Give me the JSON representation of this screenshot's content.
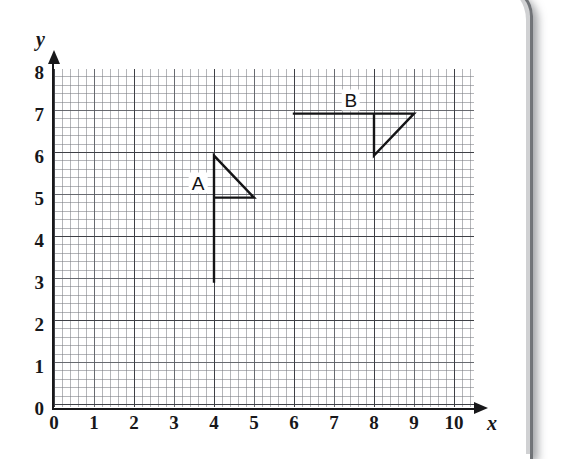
{
  "figure": {
    "type": "coordinate-grid-diagram",
    "grid": {
      "minor_divisions_per_unit": 5,
      "major_gridline_every": 2,
      "grid_color": "#787a80",
      "major_grid_color": "#3c3e44",
      "background": "#ffffff"
    },
    "axes": {
      "x": {
        "name": "x",
        "min": 0,
        "max": 10,
        "tick_step": 1,
        "ticks": [
          "0",
          "1",
          "2",
          "3",
          "4",
          "5",
          "6",
          "7",
          "8",
          "9",
          "10"
        ],
        "arrow": true,
        "color": "#18181a"
      },
      "y": {
        "name": "y",
        "min": 0,
        "max": 8,
        "tick_step": 1,
        "ticks": [
          "0",
          "1",
          "2",
          "3",
          "4",
          "5",
          "6",
          "7",
          "8"
        ],
        "arrow": true,
        "color": "#18181a"
      }
    },
    "shapes": [
      {
        "label": "A",
        "label_position": [
          3.6,
          5.35
        ],
        "stroke": "#141416",
        "stroke_width": 2.4,
        "polyline": [
          [
            4,
            3
          ],
          [
            4,
            6
          ],
          [
            5,
            5
          ],
          [
            4,
            5
          ]
        ],
        "closed": false,
        "parts": {
          "pole": [
            [
              4,
              3
            ],
            [
              4,
              6
            ]
          ],
          "triangle": [
            [
              4,
              6
            ],
            [
              5,
              5
            ],
            [
              4,
              5
            ]
          ]
        }
      },
      {
        "label": "B",
        "label_position": [
          7.42,
          7.32
        ],
        "stroke": "#141416",
        "stroke_width": 2.4,
        "polyline": [
          [
            6,
            7
          ],
          [
            9,
            7
          ],
          [
            8,
            6
          ],
          [
            8,
            7
          ]
        ],
        "closed": false,
        "parts": {
          "pole": [
            [
              6,
              7
            ],
            [
              8,
              7
            ]
          ],
          "triangle": [
            [
              8,
              7
            ],
            [
              9,
              7
            ],
            [
              8,
              6
            ]
          ]
        }
      }
    ]
  }
}
